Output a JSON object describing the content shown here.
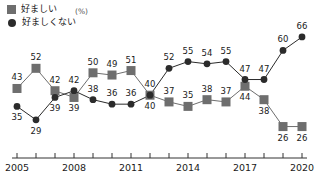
{
  "legend": {
    "items": [
      {
        "label": "好ましい",
        "marker": "square-marker-icon",
        "color": "#6e6e6e"
      },
      {
        "label": "好ましくない",
        "marker": "circle-marker-icon",
        "color": "#2b2b2b"
      }
    ]
  },
  "unit": "(%)",
  "axis": {
    "x_tick_labels": [
      "2005",
      "2008",
      "2011",
      "2014",
      "2017",
      "2020"
    ],
    "x_tick_label_years": [
      2005,
      2008,
      2011,
      2014,
      2017,
      2020
    ]
  },
  "chart_data": {
    "type": "line",
    "title": "",
    "xlabel": "",
    "ylabel": "",
    "unit": "(%)",
    "grid": false,
    "legend_position": "top-left",
    "x": [
      2005,
      2006,
      2007,
      2008,
      2009,
      2010,
      2011,
      2012,
      2013,
      2014,
      2015,
      2016,
      2017,
      2018,
      2019,
      2020
    ],
    "xlim": [
      2005,
      2020
    ],
    "ylim": [
      20,
      70
    ],
    "series": [
      {
        "name": "好ましい",
        "marker": "square",
        "color": "#6e6e6e",
        "values": [
          43,
          52,
          42,
          39,
          50,
          49,
          51,
          40,
          37,
          35,
          38,
          37,
          44,
          38,
          26,
          26
        ],
        "label_side": [
          "above",
          "above",
          "above",
          "below",
          "above",
          "above",
          "above",
          "below",
          "above",
          "above",
          "above",
          "above",
          "below",
          "below",
          "below",
          "below"
        ]
      },
      {
        "name": "好ましくない",
        "marker": "circle",
        "color": "#2b2b2b",
        "values": [
          35,
          29,
          39,
          42,
          38,
          36,
          36,
          40,
          52,
          55,
          54,
          55,
          47,
          47,
          60,
          66
        ],
        "label_side": [
          "below",
          "below",
          "below",
          "above",
          "above",
          "above",
          "above",
          "above",
          "above",
          "above",
          "above",
          "above",
          "above",
          "above",
          "above",
          "above"
        ]
      }
    ]
  }
}
